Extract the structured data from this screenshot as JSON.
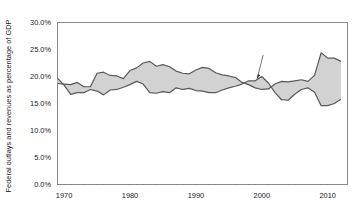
{
  "chart_data": {
    "type": "area",
    "title": "",
    "xlabel": "",
    "ylabel": "Federal outlays and revenues as percentage of GDP",
    "ylim": [
      0,
      30
    ],
    "xlim": [
      1969,
      2013
    ],
    "grid": false,
    "legend_position": "inline-annotations",
    "ytick_labels": [
      "0.0%",
      "5.0%",
      "10.0%",
      "15.0%",
      "20.0%",
      "25.0%",
      "30.0%"
    ],
    "ytick_values": [
      0,
      5,
      10,
      15,
      20,
      25,
      30
    ],
    "xtick_labels": [
      "1970",
      "1980",
      "1990",
      "2000",
      "2010"
    ],
    "xtick_values": [
      1970,
      1980,
      1990,
      2000,
      2010
    ],
    "minor_xtick_interval": 1,
    "annotations": [
      {
        "text": "Outlays",
        "x": 1981,
        "y": 25.2
      },
      {
        "text": "Deficits",
        "x": 1987,
        "y": 21.0
      },
      {
        "text": "Revenues",
        "x": 1993,
        "y": 15.6
      },
      {
        "text": "Surpluses",
        "x": 2000,
        "y": 24.6
      }
    ],
    "fill_color": "#d2d2d2",
    "line_color": "#595959",
    "x": [
      1969,
      1970,
      1971,
      1972,
      1973,
      1974,
      1975,
      1976,
      1977,
      1978,
      1979,
      1980,
      1981,
      1982,
      1983,
      1984,
      1985,
      1986,
      1987,
      1988,
      1989,
      1990,
      1991,
      1992,
      1993,
      1994,
      1995,
      1996,
      1997,
      1998,
      1999,
      2000,
      2001,
      2002,
      2003,
      2004,
      2005,
      2006,
      2007,
      2008,
      2009,
      2010,
      2011,
      2012
    ],
    "series": [
      {
        "name": "Outlays",
        "values": [
          18.7,
          18.6,
          18.5,
          18.9,
          18.1,
          18.1,
          20.6,
          20.8,
          20.2,
          20.1,
          19.6,
          21.1,
          21.6,
          22.5,
          22.8,
          21.9,
          22.2,
          21.8,
          21.0,
          20.6,
          20.5,
          21.2,
          21.7,
          21.5,
          20.7,
          20.3,
          20.1,
          19.8,
          18.9,
          18.5,
          17.9,
          17.6,
          17.7,
          18.6,
          19.1,
          19.0,
          19.2,
          19.4,
          19.1,
          20.2,
          24.4,
          23.4,
          23.4,
          22.8
        ]
      },
      {
        "name": "Revenues",
        "values": [
          19.7,
          18.4,
          16.7,
          17.0,
          17.0,
          17.6,
          17.3,
          16.6,
          17.5,
          17.6,
          18.0,
          18.5,
          19.1,
          18.6,
          17.0,
          16.9,
          17.2,
          17.0,
          17.9,
          17.6,
          17.8,
          17.4,
          17.3,
          17.0,
          17.0,
          17.5,
          17.9,
          18.2,
          18.6,
          19.2,
          19.2,
          20.0,
          18.8,
          17.0,
          15.7,
          15.6,
          16.7,
          17.6,
          17.9,
          17.1,
          14.6,
          14.6,
          15.0,
          15.8
        ]
      }
    ]
  }
}
